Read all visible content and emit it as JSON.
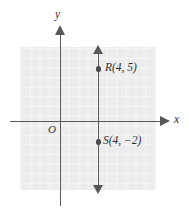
{
  "figure": {
    "type": "coordinate-plane-diagram",
    "background_color": "#ffffff",
    "grid_fill_color": "#ececec",
    "grid_line_color": "#f7f7f7",
    "axis_color": "#58585a",
    "point_color": "#4a4a4c"
  },
  "axes": {
    "x_label": "x",
    "y_label": "y",
    "origin_label": "O"
  },
  "points": [
    {
      "name": "R",
      "label": "R(4, 5)",
      "x": 4,
      "y": 5
    },
    {
      "name": "S",
      "label": "S(4, −2)",
      "x": 4,
      "y": -2
    }
  ],
  "line": {
    "description": "vertical-line-x-equals-4",
    "equation_x": 4,
    "arrow_top": true,
    "arrow_bottom": true
  }
}
